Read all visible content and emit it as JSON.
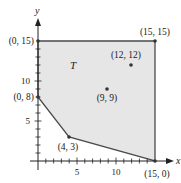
{
  "diagram": {
    "type": "feasible-region-plot",
    "region_label": "T",
    "axes": {
      "x_label": "x",
      "y_label": "y",
      "x_ticks": [
        "5",
        "10"
      ],
      "y_ticks": [
        "5",
        "10"
      ],
      "range": [
        0,
        15
      ]
    },
    "vertices": [
      {
        "label": "(0, 15)",
        "x": 0,
        "y": 15
      },
      {
        "label": "(15, 15)",
        "x": 15,
        "y": 15
      },
      {
        "label": "(15, 0)",
        "x": 15,
        "y": 0
      },
      {
        "label": "(4, 3)",
        "x": 4,
        "y": 3
      },
      {
        "label": "(0, 8)",
        "x": 0,
        "y": 8
      }
    ],
    "interior_points": [
      {
        "label": "(12, 12)",
        "x": 12,
        "y": 12
      },
      {
        "label": "(9, 9)",
        "x": 9,
        "y": 9
      }
    ],
    "colors": {
      "fill": "#e6e6e6",
      "stroke": "#4a4a4a",
      "axis": "#222222"
    }
  }
}
